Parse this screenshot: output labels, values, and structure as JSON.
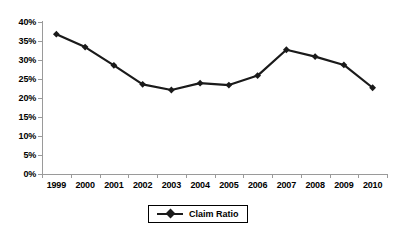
{
  "chart_data": {
    "type": "line",
    "title": "",
    "xlabel": "",
    "ylabel": "",
    "categories": [
      "1999",
      "2000",
      "2001",
      "2002",
      "2003",
      "2004",
      "2005",
      "2006",
      "2007",
      "2008",
      "2009",
      "2010"
    ],
    "series": [
      {
        "name": "Claim Ratio",
        "values": [
          36.8,
          33.4,
          28.6,
          23.6,
          22.1,
          23.9,
          23.4,
          25.9,
          32.7,
          30.9,
          28.7,
          22.7
        ]
      }
    ],
    "ylim": [
      0,
      40
    ],
    "ytick_labels": [
      "0%",
      "5%",
      "10%",
      "15%",
      "20%",
      "25%",
      "30%",
      "35%",
      "40%"
    ],
    "ytick_values": [
      0,
      5,
      10,
      15,
      20,
      25,
      30,
      35,
      40
    ],
    "grid": false,
    "legend_position": "bottom-center",
    "marker": "diamond",
    "series_color": "#1a1a1a",
    "axis_color": "#9a9a9a",
    "background_color": "#ffffff"
  },
  "legend": {
    "entries": [
      {
        "label": "Claim Ratio",
        "marker": "diamond-marker"
      }
    ]
  }
}
